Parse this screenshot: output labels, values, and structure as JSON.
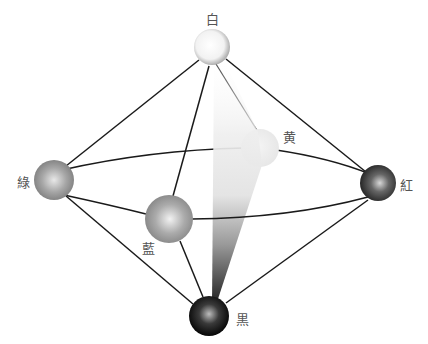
{
  "nodes": [
    {
      "id": "white",
      "label": "白",
      "meaning": "white"
    },
    {
      "id": "yellow",
      "label": "黄",
      "meaning": "yellow"
    },
    {
      "id": "green",
      "label": "綠",
      "meaning": "green"
    },
    {
      "id": "red",
      "label": "紅",
      "meaning": "red"
    },
    {
      "id": "blue",
      "label": "藍",
      "meaning": "blue"
    },
    {
      "id": "black",
      "label": "黒",
      "meaning": "black"
    }
  ],
  "edges": [
    [
      "white",
      "green"
    ],
    [
      "white",
      "red"
    ],
    [
      "white",
      "blue"
    ],
    [
      "black",
      "green"
    ],
    [
      "black",
      "red"
    ],
    [
      "black",
      "blue"
    ],
    [
      "green",
      "yellow"
    ],
    [
      "yellow",
      "red"
    ],
    [
      "green",
      "blue"
    ],
    [
      "blue",
      "red"
    ]
  ],
  "colors": {
    "edge": "#1a1a1a",
    "label": "#555555",
    "white_sphere": "#f4f4f4",
    "yellow_sphere": "#ececec",
    "green_sphere": "#9c9c9c",
    "red_sphere": "#4a4a4a",
    "blue_sphere": "#a8a8a8",
    "black_sphere": "#111111"
  }
}
